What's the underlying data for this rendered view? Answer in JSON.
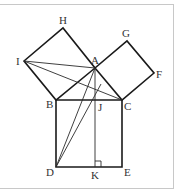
{
  "figure": {
    "points": {
      "A": {
        "label": "A",
        "x": 95,
        "y": 68
      },
      "B": {
        "label": "B",
        "x": 56,
        "y": 100
      },
      "C": {
        "label": "C",
        "x": 122,
        "y": 100
      },
      "D": {
        "label": "D",
        "x": 56,
        "y": 167
      },
      "E": {
        "label": "E",
        "x": 122,
        "y": 167
      },
      "F": {
        "label": "F",
        "x": 154,
        "y": 73
      },
      "G": {
        "label": "G",
        "x": 127,
        "y": 41
      },
      "H": {
        "label": "H",
        "x": 63,
        "y": 28
      },
      "I": {
        "label": "I",
        "x": 24,
        "y": 61
      },
      "J": {
        "label": "J",
        "x": 95,
        "y": 100
      },
      "K": {
        "label": "K",
        "x": 95,
        "y": 167
      }
    },
    "labels": {
      "A": "A",
      "B": "B",
      "C": "C",
      "D": "D",
      "E": "E",
      "F": "F",
      "G": "G",
      "H": "H",
      "I": "I",
      "J": "J",
      "K": "K"
    },
    "squares": [
      "ABHI",
      "ACFG",
      "BCED"
    ],
    "segments": [
      "I-A",
      "I-C",
      "A-D",
      "A-K",
      "D-J"
    ],
    "right_angle_marker": "K"
  }
}
